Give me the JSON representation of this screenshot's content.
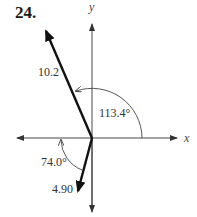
{
  "problem_number": "24.",
  "axes": {
    "x_label": "x",
    "y_label": "y"
  },
  "vectors": [
    {
      "name": "vector-a",
      "magnitude_label": "10.2",
      "angle_label": "113.4°",
      "angle_reference": "positive x-axis, counterclockwise"
    },
    {
      "name": "vector-b",
      "magnitude_label": "4.90",
      "angle_label": "74.0°",
      "angle_reference": "negative x-axis, counterclockwise"
    }
  ],
  "colors": {
    "vector": "#111111",
    "axis": "#333333",
    "text": "#333333"
  }
}
